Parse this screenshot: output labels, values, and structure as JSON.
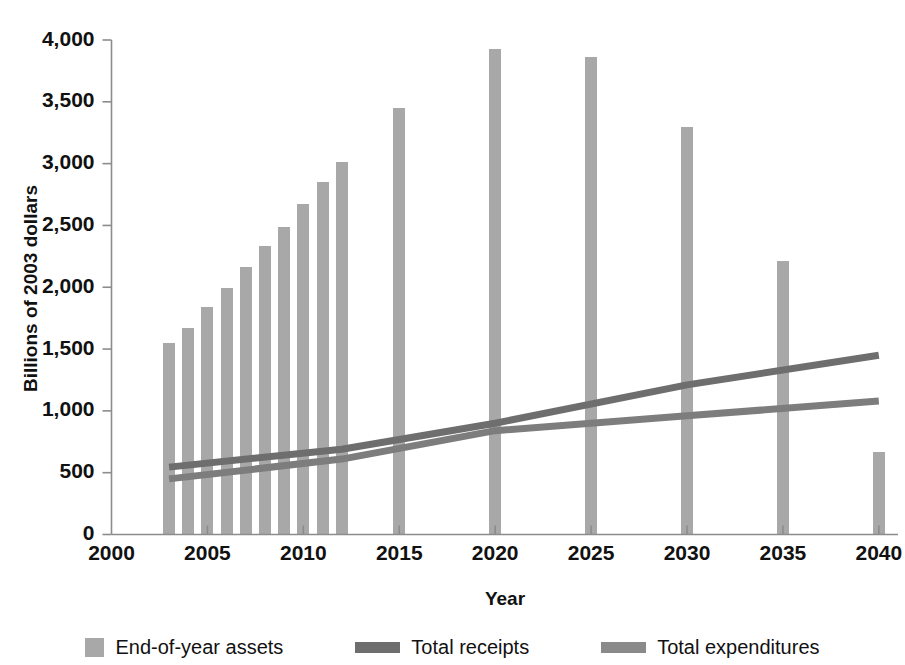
{
  "chart_data": {
    "type": "bar",
    "title": "",
    "xlabel": "Year",
    "ylabel": "Billions of 2003 dollars",
    "xlim": [
      2000,
      2041
    ],
    "ylim": [
      0,
      4000
    ],
    "grid": false,
    "legend_position": "bottom",
    "x_ticks": [
      "2000",
      "2005",
      "2010",
      "2015",
      "2020",
      "2025",
      "2030",
      "2035",
      "2040"
    ],
    "x_tick_values": [
      2000,
      2005,
      2010,
      2015,
      2020,
      2025,
      2030,
      2035,
      2040
    ],
    "y_ticks": [
      "0",
      "500",
      "1,000",
      "1,500",
      "2,000",
      "2,500",
      "3,000",
      "3,500",
      "4,000"
    ],
    "y_tick_values": [
      0,
      500,
      1000,
      1500,
      2000,
      2500,
      3000,
      3500,
      4000
    ],
    "bar_series": {
      "name": "End-of-year assets",
      "color": "#a8a8a8",
      "x": [
        2003,
        2004,
        2005,
        2006,
        2007,
        2008,
        2009,
        2010,
        2011,
        2012,
        2015,
        2020,
        2025,
        2030,
        2035,
        2040
      ],
      "values": [
        1550,
        1670,
        1840,
        1990,
        2160,
        2330,
        2490,
        2670,
        2850,
        3010,
        3450,
        3930,
        3860,
        3300,
        2210,
        670
      ]
    },
    "line_series": [
      {
        "name": "Total receipts",
        "color": "#6e6e6e",
        "x": [
          2003,
          2012,
          2020,
          2030,
          2040
        ],
        "values": [
          545,
          690,
          900,
          1210,
          1450
        ]
      },
      {
        "name": "Total expenditures",
        "color": "#7d7d7d",
        "x": [
          2003,
          2012,
          2020,
          2030,
          2040
        ],
        "values": [
          450,
          610,
          840,
          960,
          1080
        ]
      }
    ],
    "legend": [
      {
        "label": "End-of-year assets",
        "marker": "swatch",
        "color": "#a8a8a8"
      },
      {
        "label": "Total receipts",
        "marker": "line",
        "color": "#6e6e6e"
      },
      {
        "label": "Total expenditures",
        "marker": "line",
        "color": "#8a8a8a"
      }
    ]
  },
  "colors": {
    "bar": "#a8a8a8",
    "receipts": "#6e6e6e",
    "expenditures": "#8a8a8a",
    "axis": "#8c8c8c",
    "text": "#111111"
  }
}
